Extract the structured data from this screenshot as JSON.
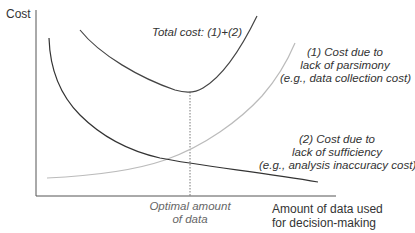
{
  "axes": {
    "y_label": "Cost",
    "x_label_line1": "Amount of data used",
    "x_label_line2": "for decision-making"
  },
  "labels": {
    "total_cost": "Total cost: (1)+(2)",
    "curve1_line1": "(1) Cost due to",
    "curve1_line2": "lack of parsimony",
    "curve1_line3": "(e.g., data collection cost)",
    "curve2_line1": "(2) Cost due to",
    "curve2_line2": "lack of sufficiency",
    "curve2_line3": "(e.g., analysis inaccuracy cost)",
    "optimal_line1": "Optimal amount",
    "optimal_line2": "of data"
  },
  "colors": {
    "axis": "#555555",
    "total_cost": "#444444",
    "curve1": "#bbbbbb",
    "curve2": "#333333",
    "optimal_marker": "#555555"
  }
}
